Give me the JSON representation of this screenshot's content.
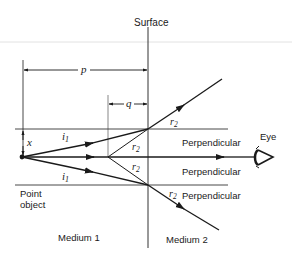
{
  "diagram": {
    "labels": {
      "surface": "Surface",
      "p": "p",
      "q": "q",
      "x": "x",
      "i1_top": "i",
      "i1_top_sub": "1",
      "i1_bottom": "i",
      "i1_bottom_sub": "1",
      "r2_top_out": "r",
      "r2_top_out_sub": "2",
      "r2_top_in": "r",
      "r2_top_in_sub": "2",
      "r2_mid": "r",
      "r2_mid_sub": "2",
      "r2_bottom": "r",
      "r2_bottom_sub": "2",
      "perpendicular_top": "Perpendicular",
      "perpendicular_mid": "Perpendicular",
      "perpendicular_bottom": "Perpendicular",
      "eye": "Eye",
      "point_object_line1": "Point",
      "point_object_line2": "object",
      "medium1": "Medium 1",
      "medium2": "Medium 2"
    },
    "colors": {
      "ink": "#1a1a1a",
      "thin": "#444444",
      "artifact": "#e2e2e2"
    }
  }
}
